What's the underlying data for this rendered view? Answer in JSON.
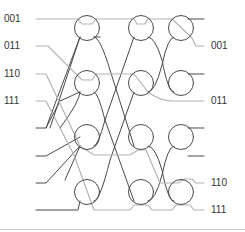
{
  "diagram": {
    "type": "butterfly-switching-network",
    "stages": 3,
    "switches_per_stage": 4,
    "inputs": 8,
    "outputs": 8,
    "colors": {
      "network_line": "#4a4a4a",
      "route_line": "#b4b4b4",
      "label": "#333333",
      "rule": "#c8c8c8"
    },
    "input_labels": [
      {
        "text": "001",
        "y": 19
      },
      {
        "text": "011",
        "y": 46
      },
      {
        "text": "110",
        "y": 74
      },
      {
        "text": "111",
        "y": 101
      }
    ],
    "output_labels": [
      {
        "text": "001",
        "y": 46
      },
      {
        "text": "011",
        "y": 101
      },
      {
        "text": "110",
        "y": 183
      },
      {
        "text": "111",
        "y": 210
      }
    ]
  }
}
